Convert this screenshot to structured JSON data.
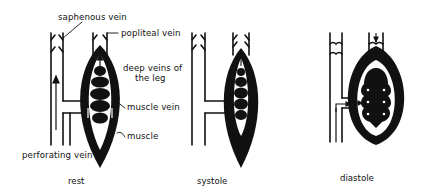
{
  "figure": {
    "panels": [
      {
        "id": "rest",
        "caption": "rest"
      },
      {
        "id": "systole",
        "caption": "systole"
      },
      {
        "id": "diastole",
        "caption": "diastole"
      }
    ],
    "labels": {
      "saphenous_vein": "saphenous vein",
      "popliteal_vein": "popliteal vein",
      "deep_veins_line1": "deep veins of",
      "deep_veins_line2": "the leg",
      "muscle_vein": "muscle vein",
      "muscle": "muscle",
      "perforating_vein": "perforating vein"
    },
    "colors": {
      "ink": "#111111",
      "background": "#ffffff"
    }
  }
}
